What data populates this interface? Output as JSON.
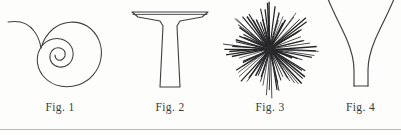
{
  "plate": {
    "background_color": "#fdfdfc",
    "ink_color": "#3e3e41",
    "rule_color": "#b9b9b9",
    "width": 401,
    "height": 135
  },
  "figures": [
    {
      "caption": "Fig. 1",
      "subject": "spiral-with-hooked-tail",
      "description": "Logarithmic spiral of about two and a half turns with a long curved tail sweeping up and to the left, meeting the outer whorl at a cusp."
    },
    {
      "caption": "Fig. 2",
      "subject": "flared-cap-column",
      "description": "T-shaped or anvil-like outline: a wide flat cap with angled shoulders descending into a slightly tapering column closed by a flat base."
    },
    {
      "caption": "Fig. 3",
      "subject": "radiating-spine-starburst",
      "description": "Dense starburst of fine straight spines radiating in all directions from a dark common centre, resembling a sea urchin or radiolarian."
    },
    {
      "caption": "Fig. 4",
      "subject": "flaring-trumpet-funnel",
      "description": "Narrow straight stem with a flat base opening upward into two strongly flaring concave curves that run off the top edge of the plate."
    }
  ]
}
